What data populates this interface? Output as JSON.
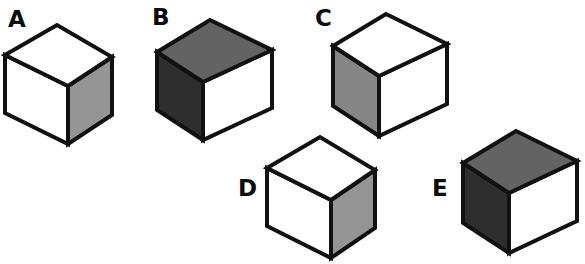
{
  "figure": {
    "background_color": "#ffffff",
    "edge_color": "#111111",
    "label_color": "#0d0d0d",
    "palette": {
      "white": "#ffffff",
      "light_gray": "#959595",
      "mid_gray": "#858585",
      "dark_gray": "#636363",
      "near_black": "#2e2e2e"
    },
    "cubes": [
      {
        "id": "cube-a",
        "label": "A",
        "label_x": 8,
        "label_y": 27,
        "orientation": "left-facing",
        "top_color": "#ffffff",
        "left_color": "#ffffff",
        "right_color": "#959595",
        "geometry": {
          "top_apex_x": 57,
          "top_apex_y": 25,
          "left_x": 5,
          "left_y": 55,
          "right_x": 112,
          "right_y": 57,
          "front_x": 68,
          "front_y": 86,
          "bottom_drop": 58
        }
      },
      {
        "id": "cube-b",
        "label": "B",
        "label_x": 152,
        "label_y": 25,
        "orientation": "right-facing",
        "top_color": "#636363",
        "left_color": "#2e2e2e",
        "right_color": "#ffffff",
        "geometry": {
          "top_apex_x": 210,
          "top_apex_y": 20,
          "left_x": 157,
          "left_y": 52,
          "right_x": 272,
          "right_y": 50,
          "front_x": 203,
          "front_y": 82,
          "bottom_drop": 58
        }
      },
      {
        "id": "cube-c",
        "label": "C",
        "label_x": 315,
        "label_y": 26,
        "orientation": "right-facing",
        "top_color": "#ffffff",
        "left_color": "#858585",
        "right_color": "#ffffff",
        "geometry": {
          "top_apex_x": 386,
          "top_apex_y": 14,
          "left_x": 333,
          "left_y": 46,
          "right_x": 447,
          "right_y": 44,
          "front_x": 379,
          "front_y": 76,
          "bottom_drop": 60
        }
      },
      {
        "id": "cube-d",
        "label": "D",
        "label_x": 238,
        "label_y": 196,
        "orientation": "left-facing",
        "top_color": "#ffffff",
        "left_color": "#ffffff",
        "right_color": "#959595",
        "geometry": {
          "top_apex_x": 320,
          "top_apex_y": 137,
          "left_x": 267,
          "left_y": 168,
          "right_x": 375,
          "right_y": 170,
          "front_x": 331,
          "front_y": 200,
          "bottom_drop": 58
        }
      },
      {
        "id": "cube-e",
        "label": "E",
        "label_x": 432,
        "label_y": 196,
        "orientation": "right-facing",
        "top_color": "#636363",
        "left_color": "#2e2e2e",
        "right_color": "#ffffff",
        "geometry": {
          "top_apex_x": 516,
          "top_apex_y": 131,
          "left_x": 463,
          "left_y": 163,
          "right_x": 577,
          "right_y": 161,
          "front_x": 509,
          "front_y": 193,
          "bottom_drop": 60
        }
      }
    ]
  }
}
